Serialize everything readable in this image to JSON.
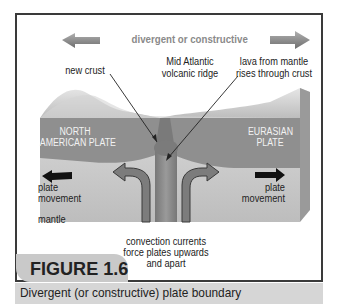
{
  "diagram": {
    "heading": "divergent or constructive",
    "labels": {
      "new_crust": "new crust",
      "ridge_line1": "Mid Atlantic",
      "ridge_line2": "volcanic ridge",
      "lava_line1": "lava from mantle",
      "lava_line2": "rises through crust",
      "na_plate_line1": "NORTH",
      "na_plate_line2": "AMERICAN PLATE",
      "eu_plate_line1": "EURASIAN",
      "eu_plate_line2": "PLATE",
      "left_movement_line1": "plate",
      "left_movement_line2": "movement",
      "right_movement_line1": "plate",
      "right_movement_line2": "movement",
      "mantle": "mantle",
      "convection_line1": "convection currents",
      "convection_line2": "force plates upwards",
      "convection_line3": "and apart"
    },
    "icons": [
      "arrow-left-icon",
      "arrow-right-icon",
      "plate-movement-left-arrow",
      "plate-movement-right-arrow",
      "convection-left-arrow",
      "convection-right-arrow"
    ],
    "colors": {
      "plate": "#8f8f8f",
      "mantle": "#c8c8c8",
      "frame": "#3a3a3a",
      "caption_bg": "#d6d6d6"
    }
  },
  "figure": {
    "label": "FIGURE 1.6",
    "caption": "Divergent (or constructive) plate boundary"
  }
}
